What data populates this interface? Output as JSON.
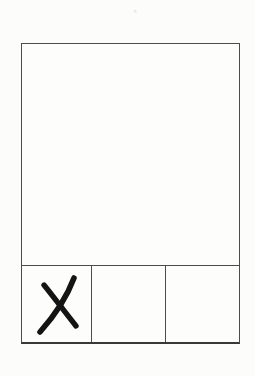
{
  "page": {
    "kind": "scanned paper form",
    "paper_color": "#fcfcfb",
    "line_color": "#4c4c4c",
    "mark_color": "#141414"
  },
  "form": {
    "main_box": {
      "content": ""
    },
    "bottom_row": {
      "cells": [
        {
          "label": "",
          "marked": true,
          "mark_glyph": "X"
        },
        {
          "label": "",
          "marked": false,
          "mark_glyph": ""
        },
        {
          "label": "",
          "marked": false,
          "mark_glyph": ""
        }
      ]
    }
  }
}
